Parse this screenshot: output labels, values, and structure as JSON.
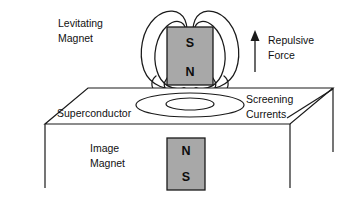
{
  "figure": {
    "background_color": "#ffffff",
    "line_color": "#1a1a1a",
    "magnet_fill_color": "#a8a8a8",
    "width": 357,
    "height": 198
  },
  "labels": {
    "levitating_magnet_line1": "Levitating",
    "levitating_magnet_line2": "Magnet",
    "repulsive_force_line1": "Repulsive",
    "repulsive_force_line2": "Force",
    "superconductor": "Superconductor",
    "screening_currents_line1": "Screening",
    "screening_currents_line2": "Currents",
    "image_magnet_line1": "Image",
    "image_magnet_line2": "Magnet"
  },
  "levitating_magnet": {
    "top_pole": "S",
    "bottom_pole": "N",
    "fill": "#a8a8a8"
  },
  "image_magnet": {
    "top_pole": "N",
    "bottom_pole": "S",
    "fill": "#a8a8a8"
  },
  "annotations": {
    "force_direction": "up",
    "field_line_count": 4,
    "screening_current_loops": 2
  }
}
